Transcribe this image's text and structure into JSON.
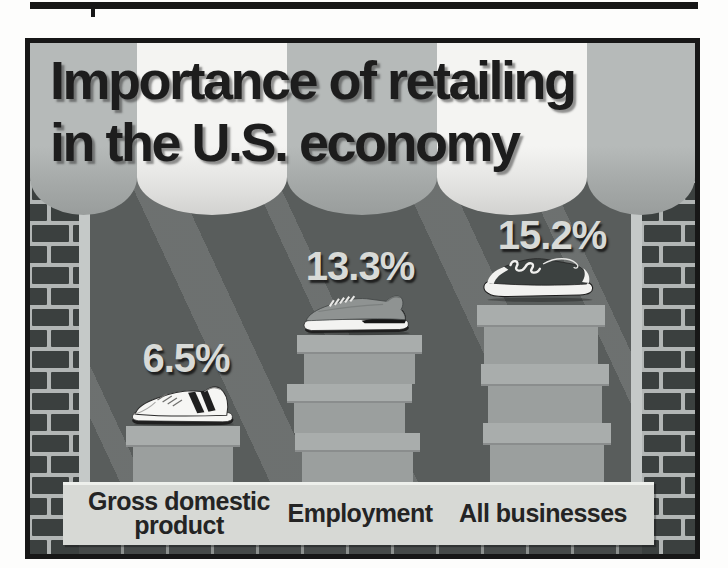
{
  "chart_data": {
    "type": "bar",
    "title": "Importance of retailing in the U.S. economy",
    "categories": [
      "Gross domestic product",
      "Employment",
      "All businesses"
    ],
    "values": [
      6.5,
      13.3,
      15.2
    ],
    "value_labels": [
      "6.5%",
      "13.3%",
      "15.2%"
    ],
    "unit": "%",
    "xlabel": "",
    "ylabel": "",
    "legend": false,
    "style": "pictograph: sneakers resting on stacks of shoeboxes (1, 3 and 3 boxes) inside a store window under a striped awning, brick walls at the sides"
  },
  "figure": {
    "title_line1": "Importance of retailing",
    "title_line2": "in the U.S. economy",
    "bars": [
      {
        "label": "Gross domestic product",
        "label_line1": "Gross domestic",
        "label_line2": "product",
        "value": "6.5%",
        "shoe_icon": "white-sneaker-icon",
        "boxes": 1,
        "box_offsets": [
          0
        ]
      },
      {
        "label": "Employment",
        "value": "13.3%",
        "shoe_icon": "gray-runner-shoe-icon",
        "boxes": 3,
        "box_offsets": [
          4,
          -6,
          2
        ]
      },
      {
        "label": "All businesses",
        "value": "15.2%",
        "shoe_icon": "dark-sneaker-icon",
        "boxes": 3,
        "box_offsets": [
          0,
          4,
          6
        ]
      }
    ],
    "colors": {
      "awning_gray": "#b6bab9",
      "awning_white": "#f4f4f2",
      "interior": "#595d5c",
      "light_beam": "rgba(255,255,255,0.12)",
      "brick": "#3b403f",
      "mortar": "#b2b6b5",
      "shelf_band": "#d7d9d5",
      "box_lid": "#a9adac",
      "box_body": "#9b9f9e",
      "title_text": "#1d1d1d",
      "percent_text": "#d8dad7",
      "label_text": "#242424"
    }
  }
}
